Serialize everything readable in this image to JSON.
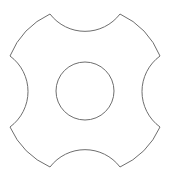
{
  "diagram": {
    "type": "line-drawing",
    "stroke_color": "#6e6e6e",
    "background": "#ffffff",
    "outer_shape": {
      "corners": [
        [
          50,
          14
        ],
        [
          120,
          14
        ],
        [
          160,
          56
        ],
        [
          160,
          127
        ],
        [
          120,
          167
        ],
        [
          50,
          167
        ],
        [
          10,
          127
        ],
        [
          10,
          56
        ]
      ],
      "notches": [
        {
          "side": "top",
          "center": [
            85,
            0
          ],
          "radius": 44
        },
        {
          "side": "right",
          "center": [
            171,
            91
          ],
          "radius": 44
        },
        {
          "side": "bottom",
          "center": [
            85,
            182
          ],
          "radius": 44
        },
        {
          "side": "left",
          "center": [
            0,
            91
          ],
          "radius": 44
        }
      ]
    },
    "inner_circle": {
      "center": [
        85,
        91
      ],
      "radius": 29
    }
  }
}
